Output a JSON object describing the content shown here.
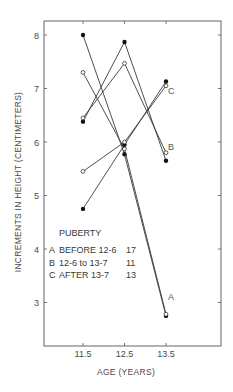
{
  "chart_data": {
    "type": "line",
    "title": "",
    "xlabel": "AGE (YEARS)",
    "ylabel": "INCREMENTS IN HEIGHT (CENTIMETERS)",
    "x": [
      11.5,
      12.5,
      13.5
    ],
    "x_tick_labels": [
      "11.5",
      "12.5",
      "13.5"
    ],
    "y_ticks": [
      3,
      4,
      5,
      6,
      7,
      8
    ],
    "ylim": [
      2.2,
      8.3
    ],
    "grid": false,
    "legend": {
      "title": "PUBERTY",
      "position": "inside lower-left",
      "entries": [
        {
          "key": "A",
          "label": "BEFORE 12-6",
          "n": "17"
        },
        {
          "key": "B",
          "label": "12-6 to 13-7",
          "n": "11"
        },
        {
          "key": "C",
          "label": "AFTER 13-7",
          "n": "13"
        }
      ]
    },
    "series": [
      {
        "name": "A (filled)",
        "group": "A",
        "marker": "filled",
        "values": [
          8.0,
          5.77,
          2.75
        ]
      },
      {
        "name": "A (open)",
        "group": "A",
        "marker": "open",
        "values": [
          7.3,
          5.87,
          2.78
        ]
      },
      {
        "name": "B (filled)",
        "group": "B",
        "marker": "filled",
        "values": [
          6.38,
          7.87,
          5.65
        ]
      },
      {
        "name": "B (open)",
        "group": "B",
        "marker": "open",
        "values": [
          6.45,
          7.47,
          5.8
        ]
      },
      {
        "name": "C (filled)",
        "group": "C",
        "marker": "filled",
        "values": [
          4.75,
          5.95,
          7.13
        ]
      },
      {
        "name": "C (open)",
        "group": "C",
        "marker": "open",
        "values": [
          5.45,
          6.0,
          7.05
        ]
      }
    ],
    "annotations": [
      {
        "text": "A",
        "at": [
          13.5,
          3.1
        ]
      },
      {
        "text": "B",
        "at": [
          13.5,
          5.9
        ]
      },
      {
        "text": "C",
        "at": [
          13.5,
          6.95
        ]
      }
    ]
  },
  "labels": {
    "y_axis": "INCREMENTS IN HEIGHT (CENTIMETERS)",
    "x_axis": "AGE (YEARS)",
    "legend_title": "PUBERTY"
  }
}
